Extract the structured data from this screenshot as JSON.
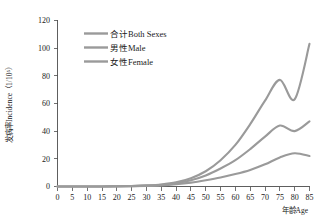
{
  "chart_data": {
    "type": "line",
    "title": "",
    "xlabel": "年龄Age",
    "ylabel": "发病率Incidence（1/10⁵）",
    "xlim": [
      0,
      85
    ],
    "ylim": [
      0,
      120
    ],
    "grid": false,
    "legend_position": "top-left-inside",
    "x_ticks": [
      0,
      5,
      10,
      15,
      20,
      25,
      30,
      35,
      40,
      45,
      50,
      55,
      60,
      65,
      70,
      75,
      80,
      85
    ],
    "y_ticks": [
      0,
      20,
      40,
      60,
      80,
      100,
      120
    ],
    "x": [
      0,
      5,
      10,
      15,
      20,
      25,
      30,
      35,
      40,
      45,
      50,
      55,
      60,
      65,
      70,
      75,
      80,
      85
    ],
    "series": [
      {
        "name": "合计Both Sexes",
        "color": "#9a9a9a",
        "values": [
          0,
          0,
          0,
          0,
          0.2,
          0.4,
          0.8,
          1.5,
          3.0,
          6.0,
          11.0,
          19.0,
          30.0,
          45.0,
          62.0,
          77.0,
          63.0,
          103.0
        ]
      },
      {
        "name": "男性Male",
        "color": "#9a9a9a",
        "values": [
          0,
          0,
          0,
          0,
          0.2,
          0.3,
          0.6,
          1.2,
          2.4,
          4.5,
          8.0,
          13.0,
          19.0,
          27.0,
          36.0,
          44.0,
          40.0,
          47.0
        ]
      },
      {
        "name": "女性Female",
        "color": "#9a9a9a",
        "values": [
          0,
          0,
          0,
          0,
          0.1,
          0.2,
          0.4,
          0.8,
          1.6,
          2.8,
          4.5,
          6.5,
          9.0,
          12.0,
          16.0,
          21.0,
          24.0,
          22.0
        ]
      }
    ]
  },
  "legend": {
    "entries": [
      {
        "label": "合计Both Sexes"
      },
      {
        "label": "男性Male"
      },
      {
        "label": "女性Female"
      }
    ]
  },
  "axes": {
    "y_title": "发病率Incidence（1/10⁵）",
    "x_title": "年龄Age",
    "y_tick_labels": [
      "0",
      "20",
      "40",
      "60",
      "80",
      "100",
      "120"
    ],
    "x_tick_labels": [
      "0",
      "5",
      "10",
      "15",
      "20",
      "25",
      "30",
      "35",
      "40",
      "45",
      "50",
      "55",
      "60",
      "65",
      "70",
      "75",
      "80",
      "85"
    ]
  },
  "colors": {
    "line": "#9a9a9a",
    "axis": "#4d4d4d",
    "text": "#1a1a1a",
    "background": "#ffffff"
  }
}
